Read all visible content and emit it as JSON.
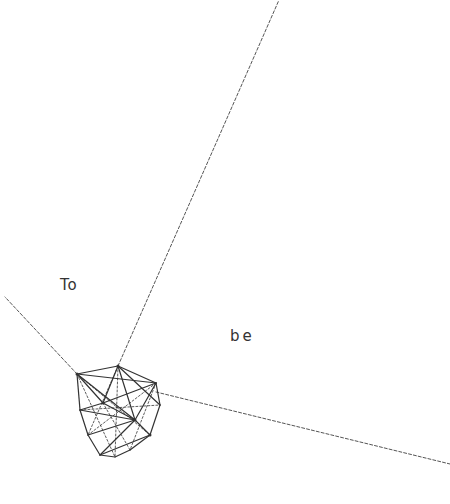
{
  "labels": {
    "left": "To",
    "right": "be"
  },
  "colors": {
    "background": "#ffffff",
    "line": "#333333",
    "ray": "#555555"
  },
  "rays": [
    {
      "name": "ray-up",
      "from": [
        118,
        366
      ],
      "to": [
        279,
        0
      ]
    },
    {
      "name": "ray-left",
      "from": [
        77,
        374
      ],
      "to": [
        5,
        297
      ]
    },
    {
      "name": "ray-right",
      "from": [
        156,
        392
      ],
      "to": [
        450,
        464
      ]
    }
  ],
  "polyhedron": {
    "outline": [
      [
        77,
        374
      ],
      [
        118,
        366
      ],
      [
        156,
        383
      ],
      [
        160,
        405
      ],
      [
        150,
        435
      ],
      [
        130,
        450
      ],
      [
        115,
        457
      ],
      [
        100,
        455
      ],
      [
        88,
        435
      ],
      [
        80,
        410
      ]
    ],
    "solid_edges": [
      [
        [
          77,
          374
        ],
        [
          118,
          366
        ]
      ],
      [
        [
          118,
          366
        ],
        [
          156,
          383
        ]
      ],
      [
        [
          156,
          383
        ],
        [
          160,
          405
        ]
      ],
      [
        [
          160,
          405
        ],
        [
          150,
          435
        ]
      ],
      [
        [
          150,
          435
        ],
        [
          130,
          450
        ]
      ],
      [
        [
          130,
          450
        ],
        [
          115,
          457
        ]
      ],
      [
        [
          115,
          457
        ],
        [
          100,
          455
        ]
      ],
      [
        [
          100,
          455
        ],
        [
          88,
          435
        ]
      ],
      [
        [
          88,
          435
        ],
        [
          80,
          410
        ]
      ],
      [
        [
          80,
          410
        ],
        [
          77,
          374
        ]
      ],
      [
        [
          77,
          374
        ],
        [
          103,
          403
        ]
      ],
      [
        [
          118,
          366
        ],
        [
          103,
          403
        ]
      ],
      [
        [
          156,
          383
        ],
        [
          103,
          403
        ]
      ],
      [
        [
          103,
          403
        ],
        [
          135,
          420
        ]
      ],
      [
        [
          135,
          420
        ],
        [
          156,
          383
        ]
      ],
      [
        [
          135,
          420
        ],
        [
          118,
          366
        ]
      ],
      [
        [
          80,
          410
        ],
        [
          103,
          403
        ]
      ],
      [
        [
          80,
          410
        ],
        [
          135,
          420
        ]
      ],
      [
        [
          88,
          435
        ],
        [
          135,
          420
        ]
      ],
      [
        [
          135,
          420
        ],
        [
          150,
          435
        ]
      ],
      [
        [
          135,
          420
        ],
        [
          100,
          455
        ]
      ],
      [
        [
          77,
          374
        ],
        [
          156,
          383
        ]
      ],
      [
        [
          118,
          366
        ],
        [
          160,
          405
        ]
      ],
      [
        [
          77,
          374
        ],
        [
          135,
          420
        ]
      ],
      [
        [
          100,
          455
        ],
        [
          150,
          435
        ]
      ]
    ],
    "dashed_edges": [
      [
        [
          77,
          374
        ],
        [
          115,
          457
        ]
      ],
      [
        [
          118,
          366
        ],
        [
          115,
          457
        ]
      ],
      [
        [
          156,
          383
        ],
        [
          88,
          435
        ]
      ],
      [
        [
          80,
          410
        ],
        [
          160,
          405
        ]
      ],
      [
        [
          103,
          403
        ],
        [
          130,
          450
        ]
      ],
      [
        [
          118,
          366
        ],
        [
          88,
          435
        ]
      ],
      [
        [
          156,
          383
        ],
        [
          130,
          450
        ]
      ],
      [
        [
          77,
          374
        ],
        [
          150,
          435
        ]
      ]
    ],
    "vertex_marks": [
      [
        103,
        403
      ],
      [
        135,
        420
      ],
      [
        118,
        366
      ],
      [
        77,
        374
      ],
      [
        150,
        435
      ]
    ]
  }
}
